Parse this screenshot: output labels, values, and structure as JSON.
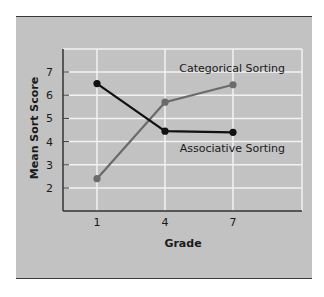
{
  "chart_data": {
    "type": "line",
    "title": "",
    "xlabel": "Grade",
    "ylabel": "Mean Sort Score",
    "categories": [
      "1",
      "4",
      "7"
    ],
    "y_ticks": [
      "2",
      "3",
      "4",
      "5",
      "6",
      "7"
    ],
    "ylim": [
      1.1,
      8.0
    ],
    "grid": true,
    "series": [
      {
        "name": "Categorical Sorting",
        "color": "#6b6b6b",
        "values": [
          2.4,
          5.7,
          6.45
        ]
      },
      {
        "name": "Associative Sorting",
        "color": "#111111",
        "values": [
          6.5,
          4.45,
          4.4
        ]
      }
    ],
    "legend_position": "inline labels near lines"
  },
  "colors": {
    "panel_bg": "#c2c2c2",
    "grid": "#f2f2f2",
    "border": "#3a3a3a"
  }
}
